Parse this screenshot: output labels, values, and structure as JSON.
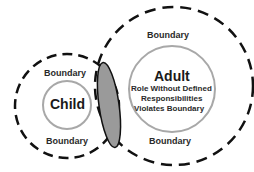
{
  "diagram": {
    "child": {
      "title": "Child",
      "boundary_top": "Boundary",
      "boundary_bottom": "Boundary"
    },
    "adult": {
      "title": "Adult",
      "lines": [
        "Role Without Defined",
        "Responsibilities",
        "Violates Boundary"
      ],
      "boundary_top": "Boundary",
      "boundary_bottom": "Boundary"
    },
    "overlap_color": "#9a9a9a",
    "inner_circle_color": "#a8a8a8",
    "dash_color": "#111111"
  }
}
